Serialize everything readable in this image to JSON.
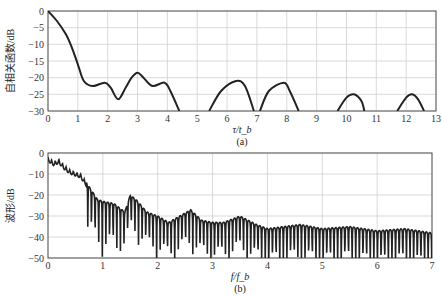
{
  "chart_data": [
    {
      "type": "line",
      "title": "",
      "caption": "(a)",
      "xlabel": "τ/t_b",
      "ylabel": "自相关函数/dB",
      "xlim": [
        0,
        13
      ],
      "ylim": [
        -30,
        0
      ],
      "xticks": [
        0,
        1,
        2,
        3,
        4,
        5,
        6,
        7,
        8,
        9,
        10,
        11,
        12,
        13
      ],
      "yticks": [
        0,
        -5,
        -10,
        -15,
        -20,
        -25,
        -30
      ],
      "grid": true,
      "legend": null,
      "series": [
        {
          "name": "autocorrelation",
          "x": [
            0,
            0.3,
            0.6,
            0.8,
            1.0,
            1.2,
            1.5,
            1.9,
            2.1,
            2.35,
            2.6,
            2.8,
            3.0,
            3.2,
            3.5,
            3.9,
            4.1,
            4.4,
            5.4,
            5.8,
            6.3,
            6.6,
            6.9,
            7.1,
            7.4,
            7.9,
            8.1,
            8.4,
            9.7,
            10.0,
            10.25,
            10.5,
            10.6,
            11.7,
            12.0,
            12.2,
            12.4,
            12.6
          ],
          "y": [
            0,
            -3,
            -7,
            -11,
            -16,
            -21,
            -22.5,
            -21.5,
            -23,
            -26.5,
            -23,
            -20,
            -18.5,
            -20,
            -22.5,
            -21.5,
            -24,
            -30,
            -30,
            -24,
            -21,
            -22.5,
            -30,
            -30,
            -24,
            -21.5,
            -24,
            -30,
            -30,
            -26,
            -25,
            -27,
            -30,
            -30,
            -26,
            -25,
            -26.5,
            -30
          ]
        }
      ]
    },
    {
      "type": "line",
      "title": "",
      "caption": "(b)",
      "xlabel": "f/f_b",
      "ylabel": "波形/dB",
      "xlim": [
        0,
        7
      ],
      "ylim": [
        -50,
        0
      ],
      "xticks": [
        0,
        1,
        2,
        3,
        4,
        5,
        6,
        7
      ],
      "yticks": [
        0,
        -10,
        -20,
        -30,
        -40,
        -50
      ],
      "grid": true,
      "legend": null,
      "series": [
        {
          "name": "spectrum envelope",
          "x": [
            0,
            0.1,
            0.2,
            0.3,
            0.4,
            0.5,
            0.6,
            0.7,
            0.8,
            0.9,
            1.0,
            1.2,
            1.4,
            1.5,
            1.6,
            1.8,
            2.0,
            2.2,
            2.4,
            2.6,
            2.8,
            3.0,
            3.2,
            3.5,
            3.8,
            4.0,
            4.3,
            4.6,
            5.0,
            5.5,
            6.0,
            6.5,
            7.0
          ],
          "y": [
            -2,
            -4,
            -3,
            -6,
            -8,
            -9,
            -10,
            -14,
            -18,
            -22,
            -23,
            -24,
            -28,
            -20,
            -22,
            -28,
            -30,
            -33,
            -30,
            -27,
            -32,
            -33,
            -33,
            -30,
            -34,
            -36,
            -35,
            -34,
            -36,
            -35,
            -37,
            -36,
            -38
          ]
        }
      ]
    }
  ]
}
